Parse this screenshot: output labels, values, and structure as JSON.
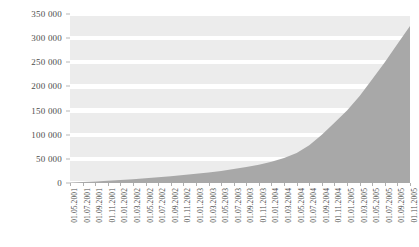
{
  "chart_data": {
    "type": "area",
    "title": "",
    "subtitle": "",
    "xlabel": "",
    "ylabel": "",
    "ylim": [
      0,
      350000
    ],
    "ytick_labels": [
      "0",
      "50 000",
      "100 000",
      "150 000",
      "200 000",
      "250 000",
      "300 000",
      "350 000"
    ],
    "ytick_values": [
      0,
      50000,
      100000,
      150000,
      200000,
      250000,
      300000,
      350000
    ],
    "grid": "horizontal-bands",
    "legend": "none",
    "annotations": [],
    "colors": {
      "area_fill": "#a8a8a8",
      "band_light": "#ececec",
      "plot_background": "#ffffff",
      "tick_text": "#4d4d4d",
      "page_background": "#ffffff"
    },
    "categories": [
      "01.05.2001",
      "01.07.2001",
      "01.09.2001",
      "01.11.2001",
      "01.01.2002",
      "01.03.2002",
      "01.05.2002",
      "01.07.2002",
      "01.09.2002",
      "01.11.2002",
      "01.01.2003",
      "01.03.2003",
      "01.05.2003",
      "01.07.2003",
      "01.09.2003",
      "01.11.2003",
      "01.01.2004",
      "01.03.2004",
      "01.05.2004",
      "01.07.2004",
      "01.09.2004",
      "01.11.2004",
      "01.01.2005",
      "01.03.2005",
      "01.05.2005",
      "01.07.2005",
      "01.09.2005",
      "01.11.2005"
    ],
    "values": [
      1000,
      2000,
      3000,
      4500,
      6000,
      8000,
      10000,
      12000,
      14000,
      16500,
      19000,
      22000,
      25000,
      29000,
      33000,
      38000,
      44000,
      52000,
      62000,
      78000,
      100000,
      125000,
      150000,
      180000,
      215000,
      250000,
      288000,
      325000
    ]
  }
}
